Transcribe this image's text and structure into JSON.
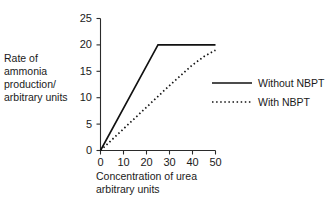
{
  "chart_data": {
    "type": "line",
    "title": "",
    "xlabel": "Concentration of urea arbitrary units",
    "ylabel": "Rate of ammonia production/ arbitrary units",
    "xlim": [
      0,
      50
    ],
    "ylim": [
      0,
      25
    ],
    "xticks": [
      0,
      10,
      20,
      30,
      40,
      50
    ],
    "yticks": [
      0,
      5,
      10,
      15,
      20,
      25
    ],
    "xtick_labels": [
      "0",
      "10",
      "20",
      "30",
      "40",
      "50"
    ],
    "ytick_labels": [
      "0",
      "5",
      "10",
      "15",
      "20",
      "25"
    ],
    "grid": false,
    "legend_position": "right",
    "series": [
      {
        "name": "Without NBPT",
        "style": "solid",
        "color": "#111111",
        "x": [
          0,
          25,
          50
        ],
        "y": [
          0,
          20,
          20
        ]
      },
      {
        "name": "With NBPT",
        "style": "dotted",
        "color": "#111111",
        "x": [
          0,
          10,
          20,
          30,
          40,
          45,
          50
        ],
        "y": [
          0,
          4.1,
          8.2,
          12.3,
          16.2,
          17.8,
          19.0
        ]
      }
    ]
  },
  "axes": {
    "y_title_lines": [
      "Rate of",
      "ammonia",
      "production/",
      "arbitrary units"
    ],
    "x_title_lines": [
      "Concentration of urea",
      "arbitrary units"
    ]
  },
  "legend": {
    "entries": [
      {
        "label": "Without NBPT",
        "style": "solid"
      },
      {
        "label": "With NBPT",
        "style": "dotted"
      }
    ]
  }
}
